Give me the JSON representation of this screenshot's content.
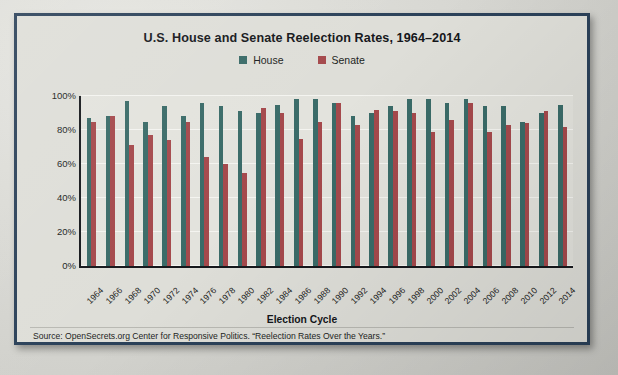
{
  "chart_data": {
    "type": "bar",
    "title": "U.S. House and Senate Reelection Rates, 1964–2014",
    "xlabel": "Election Cycle",
    "ylabel": "",
    "ylim": [
      0,
      100
    ],
    "yticks": [
      "0%",
      "20%",
      "40%",
      "60%",
      "80%",
      "100%"
    ],
    "ytick_values": [
      0,
      20,
      40,
      60,
      80,
      100
    ],
    "grid": true,
    "legend_position": "top-center",
    "categories": [
      "1964",
      "1966",
      "1968",
      "1970",
      "1972",
      "1974",
      "1976",
      "1978",
      "1980",
      "1982",
      "1984",
      "1986",
      "1988",
      "1990",
      "1992",
      "1994",
      "1996",
      "1998",
      "2000",
      "2002",
      "2004",
      "2006",
      "2008",
      "2010",
      "2012",
      "2014"
    ],
    "series": [
      {
        "name": "House",
        "color": "#3a6b68",
        "values": [
          87,
          88,
          97,
          85,
          94,
          88,
          96,
          94,
          91,
          90,
          95,
          98,
          98,
          96,
          88,
          90,
          94,
          98,
          98,
          96,
          98,
          94,
          94,
          85,
          90,
          95
        ]
      },
      {
        "name": "Senate",
        "color": "#a5494c",
        "values": [
          85,
          88,
          71,
          77,
          74,
          85,
          64,
          60,
          55,
          93,
          90,
          75,
          85,
          96,
          83,
          92,
          91,
          90,
          79,
          86,
          96,
          79,
          83,
          84,
          91,
          82
        ]
      }
    ],
    "source_note": "Source: OpenSecrets.org Center for Responsive Politics. “Reelection Rates Over the Years.”"
  },
  "legend": {
    "items": [
      {
        "label": "House",
        "color": "#3a6b68",
        "swatch_icon": "square-swatch-icon"
      },
      {
        "label": "Senate",
        "color": "#a5494c",
        "swatch_icon": "square-swatch-icon"
      }
    ]
  },
  "colors": {
    "frame_border": "#2b4159",
    "panel_background": "#dedeD8",
    "plot_background": "#e3e3dd",
    "gridline": "#f4f4f0",
    "axis": "#16181c",
    "house": "#3a6b68",
    "senate": "#a5494c",
    "text": "#14161a"
  }
}
